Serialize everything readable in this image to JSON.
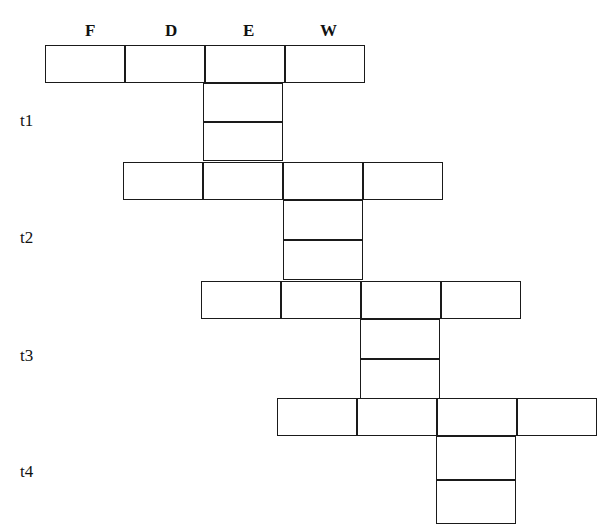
{
  "diagram": {
    "type": "pipeline-cascade-grid",
    "width": 613,
    "height": 530,
    "stroke_color": "#1a1a1a",
    "background_color": "#ffffff",
    "column_headers": [
      {
        "label": "F",
        "x": 85,
        "y": 22
      },
      {
        "label": "D",
        "x": 165,
        "y": 22
      },
      {
        "label": "E",
        "x": 243,
        "y": 22
      },
      {
        "label": "W",
        "x": 320,
        "y": 22
      }
    ],
    "time_labels": [
      {
        "label": "t1",
        "x": 20,
        "y": 112
      },
      {
        "label": "t2",
        "x": 20,
        "y": 229
      },
      {
        "label": "t3",
        "x": 20,
        "y": 347
      },
      {
        "label": "t4",
        "x": 20,
        "y": 463
      }
    ],
    "rows": [
      {
        "name": "row-1",
        "x": 45,
        "y": 45,
        "cells": 4,
        "cell_width": 80,
        "height": 38
      },
      {
        "name": "row-2",
        "x": 123,
        "y": 162,
        "cells": 4,
        "cell_width": 80,
        "height": 38
      },
      {
        "name": "row-3",
        "x": 201,
        "y": 281,
        "cells": 4,
        "cell_width": 80,
        "height": 38
      },
      {
        "name": "row-4",
        "x": 277,
        "y": 398,
        "cells": 4,
        "cell_width": 80,
        "height": 38
      }
    ],
    "tails": [
      {
        "name": "tail-1",
        "x": 203,
        "y": 83,
        "cell_width": 80,
        "cell_height": 39,
        "cells": 2
      },
      {
        "name": "tail-2",
        "x": 283,
        "y": 200,
        "cell_width": 80,
        "cell_height": 40,
        "cells": 2
      },
      {
        "name": "tail-3",
        "x": 360,
        "y": 319,
        "cell_width": 80,
        "cell_height": 40,
        "cells": 2
      },
      {
        "name": "tail-4",
        "x": 436,
        "y": 436,
        "cell_width": 80,
        "cell_height": 44,
        "cells": 2
      }
    ]
  }
}
